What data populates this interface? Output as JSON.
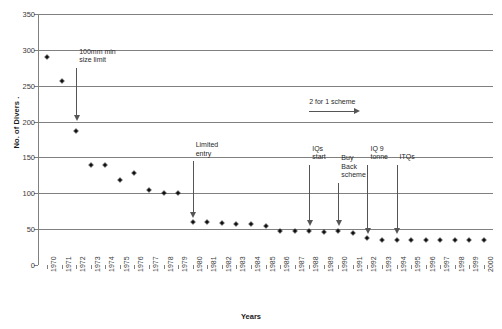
{
  "chart_data": {
    "type": "scatter",
    "title": "",
    "xlabel": "Years",
    "ylabel": "No. of Divers .",
    "xlim": [
      1970,
      2000
    ],
    "ylim": [
      0,
      350
    ],
    "ytick_step": 50,
    "grid": true,
    "legend": false,
    "marker": "diamond",
    "marker_color": "#111111",
    "gridline_color": "#808080",
    "x": [
      1970,
      1971,
      1972,
      1973,
      1974,
      1975,
      1976,
      1977,
      1978,
      1979,
      1980,
      1981,
      1982,
      1983,
      1984,
      1985,
      1986,
      1987,
      1988,
      1989,
      1990,
      1991,
      1992,
      1993,
      1994,
      1995,
      1996,
      1997,
      1998,
      1999,
      2000
    ],
    "yticks": [
      0,
      50,
      100,
      150,
      200,
      250,
      300,
      350
    ],
    "xticks": [
      "1970",
      "1971",
      "1972",
      "1973",
      "1974",
      "1975",
      "1976",
      "1977",
      "1978",
      "1979",
      "1980",
      "1981",
      "1982",
      "1983",
      "1984",
      "1985",
      "1986",
      "1987",
      "1988",
      "1989",
      "1990",
      "1991",
      "1992",
      "1993",
      "1994",
      "1995",
      "1996",
      "1997",
      "1998",
      "1999",
      "2000"
    ],
    "values": [
      290,
      257,
      187,
      140,
      140,
      118,
      128,
      105,
      100,
      100,
      60,
      60,
      58,
      57,
      57,
      55,
      48,
      48,
      48,
      46,
      48,
      44,
      38,
      35,
      35,
      35,
      35,
      35,
      35,
      35,
      35
    ],
    "series": [
      {
        "name": "No. of Divers",
        "values": [
          290,
          257,
          187,
          140,
          140,
          118,
          128,
          105,
          100,
          100,
          60,
          60,
          58,
          57,
          57,
          55,
          48,
          48,
          48,
          46,
          48,
          44,
          38,
          35,
          35,
          35,
          35,
          35,
          35,
          35,
          35
        ]
      }
    ],
    "annotations": [
      {
        "text": "100mm min\nsize limit",
        "x": 1972,
        "arrow": "down",
        "from_y": 275,
        "to_y": 208
      },
      {
        "text": "Limited\nentry",
        "x": 1980,
        "arrow": "down",
        "from_y": 145,
        "to_y": 72
      },
      {
        "text": "2 for 1 scheme",
        "x": 1988,
        "arrow": "right",
        "y": 215
      },
      {
        "text": "IQs\nstart",
        "x": 1988,
        "arrow": "down",
        "from_y": 140,
        "to_y": 62
      },
      {
        "text": "Buy\nBack\nscheme",
        "x": 1990,
        "arrow": "down",
        "from_y": 115,
        "to_y": 62
      },
      {
        "text": "IQ 9\ntonne",
        "x": 1992,
        "arrow": "down",
        "from_y": 140,
        "to_y": 50
      },
      {
        "text": "ITQs",
        "x": 1994,
        "arrow": "down",
        "from_y": 140,
        "to_y": 50
      }
    ]
  }
}
